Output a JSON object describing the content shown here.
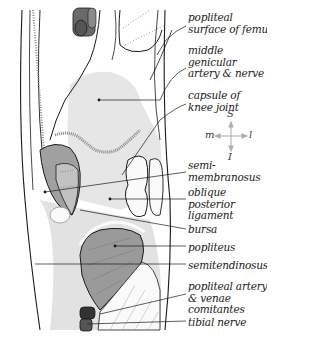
{
  "diagram": {
    "labels": [
      {
        "id": "popliteal-surface",
        "text": "popliteal\nsurface of femur",
        "x": 188,
        "y": 12
      },
      {
        "id": "middle-genicular",
        "text": "middle\ngenicular\nartery & nerve",
        "x": 188,
        "y": 45
      },
      {
        "id": "capsule",
        "text": "capsule of\nknee joint",
        "x": 188,
        "y": 90
      },
      {
        "id": "semimembranosus",
        "text": "semi-\nmembranosus",
        "x": 188,
        "y": 160
      },
      {
        "id": "oblique-posterior-ligament",
        "text": "oblique\nposterior\nligament",
        "x": 188,
        "y": 187
      },
      {
        "id": "bursa",
        "text": "bursa",
        "x": 188,
        "y": 224
      },
      {
        "id": "popliteus",
        "text": "popliteus",
        "x": 188,
        "y": 242
      },
      {
        "id": "semitendinosus",
        "text": "semitendinosus",
        "x": 188,
        "y": 260
      },
      {
        "id": "popliteal-artery",
        "text": "popliteal artery\n& venae\ncomitantes",
        "x": 188,
        "y": 281
      },
      {
        "id": "tibial-nerve",
        "text": "tibial nerve",
        "x": 188,
        "y": 317
      }
    ],
    "compass": {
      "superior": "S",
      "inferior": "I",
      "medial": "m",
      "lateral": "l"
    },
    "colors": {
      "line": "#1a1a1a",
      "light_fill": "#e4e4e4",
      "mid_fill": "#c8c8c8",
      "dark_fill": "#8a8a8a",
      "vessel": "#555555",
      "compass": "#b0b0b0"
    }
  }
}
